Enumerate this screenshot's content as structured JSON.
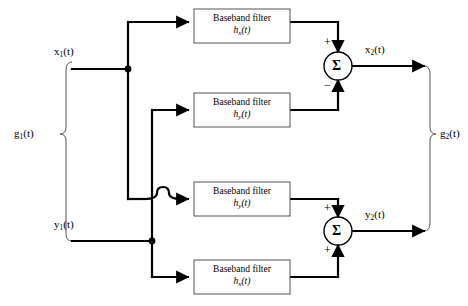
{
  "diagram": {
    "type": "block-diagram",
    "colors": {
      "wire": "#000000",
      "box_border": "#555555",
      "brace": "#555555",
      "background": "#ffffff"
    },
    "inputs": [
      {
        "id": "x1",
        "label_html": "x<sub>1</sub>(t)",
        "label": "x1(t)"
      },
      {
        "id": "y1",
        "label_html": "y<sub>1</sub>(t)",
        "label": "y1(t)"
      }
    ],
    "outputs": [
      {
        "id": "x2",
        "label_html": "x<sub>2</sub>(t)",
        "label": "x2(t)"
      },
      {
        "id": "y2",
        "label_html": "y<sub>2</sub>(t)",
        "label": "y2(t)"
      }
    ],
    "group_labels": {
      "input_group_html": "g<sub>1</sub>(t)",
      "input_group": "g1(t)",
      "output_group_html": "g<sub>2</sub>(t)",
      "output_group": "g2(t)"
    },
    "blocks": [
      {
        "id": "filter-1",
        "line1": "Baseband filter",
        "line2_html": "h<sub>x</sub>(t)",
        "line2": "hx(t)",
        "source": "x1",
        "target": "summer-top",
        "target_sign": "+"
      },
      {
        "id": "filter-2",
        "line1": "Baseband filter",
        "line2_html": "h<sub>y</sub>(t)",
        "line2": "hy(t)",
        "source": "y1",
        "target": "summer-top",
        "target_sign": "−"
      },
      {
        "id": "filter-3",
        "line1": "Baseband filter",
        "line2_html": "h<sub>y</sub>(t)",
        "line2": "hy(t)",
        "source": "x1",
        "target": "summer-bottom",
        "target_sign": "+"
      },
      {
        "id": "filter-4",
        "line1": "Baseband filter",
        "line2_html": "h<sub>x</sub>(t)",
        "line2": "hx(t)",
        "source": "y1",
        "target": "summer-bottom",
        "target_sign": "+"
      }
    ],
    "summers": [
      {
        "id": "summer-top",
        "glyph": "Σ",
        "output": "x2",
        "top_sign": "+",
        "bottom_sign": "−"
      },
      {
        "id": "summer-bottom",
        "glyph": "Σ",
        "output": "y2",
        "top_sign": "+",
        "bottom_sign": "+"
      }
    ]
  }
}
